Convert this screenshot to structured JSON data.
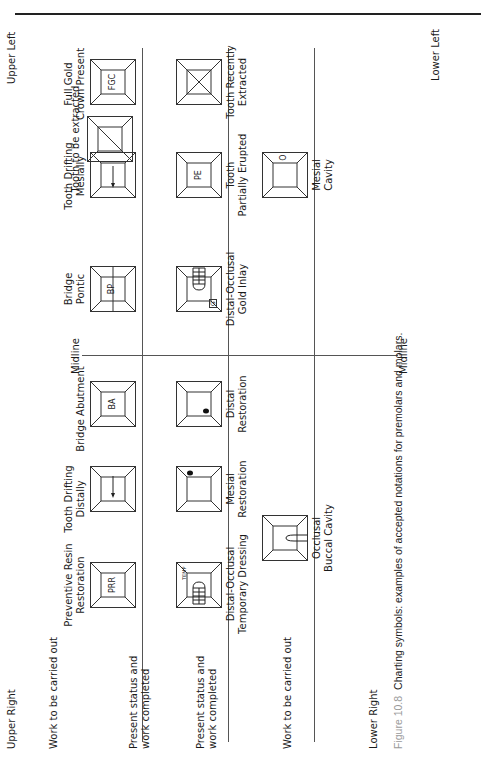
{
  "figure": {
    "number_label": "Figure 10.8",
    "caption": "Charting symbols: examples of accepted notations for premolars and molars."
  },
  "quadrants": {
    "upper_right": "Upper Right",
    "upper_left": "Upper Left",
    "lower_right": "Lower Right",
    "lower_left": "Lower Left"
  },
  "midline": {
    "top_label": "Midline",
    "bottom_label": "Midline"
  },
  "row_labels": {
    "upper_work": "Work to be carried out",
    "upper_present_line1": "Present status and",
    "upper_present_line2": "work completed",
    "lower_present_line1": "Present status and",
    "lower_present_line2": "work completed",
    "lower_work": "Work to be carried out"
  },
  "symbols": {
    "upper_work": [
      {
        "id": "tooth-to-be-extracted",
        "label_line1": "Tooth to be extracted",
        "label_line2": "",
        "code": ""
      }
    ],
    "upper_present": [
      {
        "id": "preventive-resin-restoration",
        "label_line1": "Preventive Resin",
        "label_line2": "Restoration",
        "code": "PRR"
      },
      {
        "id": "tooth-drifting-distally",
        "label_line1": "Tooth Drifting",
        "label_line2": "Distally",
        "code": ""
      },
      {
        "id": "bridge-abutment",
        "label_line1": "Bridge Abutment",
        "label_line2": "",
        "code": "BA"
      },
      {
        "id": "bridge-pontic",
        "label_line1": "Bridge",
        "label_line2": "Pontic",
        "code": "BP"
      },
      {
        "id": "tooth-drifting-mesially",
        "label_line1": "Tooth Drifting",
        "label_line2": "Mesially",
        "code": ""
      },
      {
        "id": "full-gold-crown-present",
        "label_line1": "Full Gold",
        "label_line2": "Crown Present",
        "code": "FGC"
      }
    ],
    "lower_present": [
      {
        "id": "distal-occlusal-temporary-dressing",
        "label_line1": "Distal-Occlusal",
        "label_line2": "Temporary Dressing",
        "code": "TEMP"
      },
      {
        "id": "mesial-restoration",
        "label_line1": "Mesial",
        "label_line2": "Restoration",
        "code": ""
      },
      {
        "id": "distal-restoration",
        "label_line1": "Distal",
        "label_line2": "Restoration",
        "code": ""
      },
      {
        "id": "distal-occlusal-gold-inlay",
        "label_line1": "Distal-Occlusal",
        "label_line2": "Gold Inlay",
        "code": "G"
      },
      {
        "id": "tooth-partially-erupted",
        "label_line1": "Tooth",
        "label_line2": "Partially Erupted",
        "code": "PE"
      },
      {
        "id": "tooth-recently-extracted",
        "label_line1": "Tooth Recently",
        "label_line2": "Extracted",
        "code": ""
      }
    ],
    "lower_work": [
      {
        "id": "occlusal-buccal-cavity",
        "label_line1": "Occlusal",
        "label_line2": "Buccal Cavity",
        "code": ""
      },
      {
        "id": "mesial-cavity",
        "label_line1": "Mesial",
        "label_line2": "Cavity",
        "code": "O"
      }
    ]
  },
  "colors": {
    "line": "#555555",
    "text": "#1a1a1a",
    "figure_label": "#9a9a9a"
  }
}
